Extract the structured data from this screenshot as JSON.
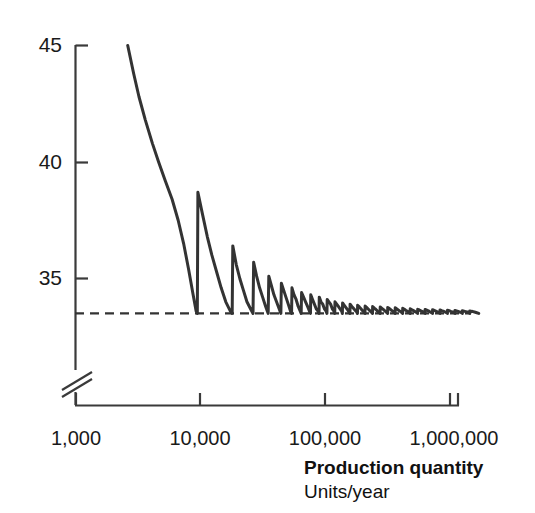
{
  "chart_data": {
    "type": "line",
    "title": "",
    "xlabel": "Production quantity",
    "xlabel_sub": "Units/year",
    "ylabel": "",
    "xscale": "log",
    "xlim": [
      1000,
      2000000
    ],
    "ylim": [
      33.0,
      45.0
    ],
    "y_axis_break": true,
    "grid": false,
    "legend": null,
    "x_tick_labels": [
      "1,000",
      "10,000",
      "100,000",
      "1,000,000"
    ],
    "x_tick_values": [
      1000,
      10000,
      100000,
      1000000
    ],
    "y_tick_labels": [
      "45",
      "40",
      "35"
    ],
    "y_tick_values": [
      45,
      40,
      35
    ],
    "line_color": "#333333",
    "asymptote": {
      "value": 33.5,
      "style": "dashed",
      "color": "#333333",
      "label": ""
    },
    "series": [
      {
        "name": "Unit cost",
        "points": [
          [
            2600,
            45.0
          ],
          [
            2900,
            43.8
          ],
          [
            3200,
            42.8
          ],
          [
            3600,
            41.8
          ],
          [
            4100,
            40.8
          ],
          [
            4600,
            40.0
          ],
          [
            5200,
            39.2
          ],
          [
            5900,
            38.4
          ],
          [
            6600,
            37.5
          ],
          [
            7300,
            36.5
          ],
          [
            8000,
            35.4
          ],
          [
            8700,
            34.3
          ],
          [
            9200,
            33.6
          ],
          [
            9400,
            33.5
          ],
          [
            9500,
            38.7
          ],
          [
            10400,
            37.7
          ],
          [
            11300,
            36.8
          ],
          [
            12300,
            36.0
          ],
          [
            13400,
            35.3
          ],
          [
            14600,
            34.6
          ],
          [
            15900,
            34.0
          ],
          [
            17300,
            33.6
          ],
          [
            17900,
            33.5
          ],
          [
            18100,
            36.4
          ],
          [
            19300,
            35.6
          ],
          [
            20600,
            35.0
          ],
          [
            22000,
            34.5
          ],
          [
            23500,
            34.0
          ],
          [
            25100,
            33.7
          ],
          [
            26300,
            33.5
          ],
          [
            26600,
            35.7
          ],
          [
            28100,
            35.1
          ],
          [
            29700,
            34.6
          ],
          [
            31400,
            34.2
          ],
          [
            33200,
            33.8
          ],
          [
            34800,
            33.5
          ],
          [
            35200,
            35.1
          ],
          [
            36900,
            34.7
          ],
          [
            38700,
            34.3
          ],
          [
            40600,
            34.0
          ],
          [
            42600,
            33.7
          ],
          [
            44000,
            33.5
          ],
          [
            44400,
            34.8
          ],
          [
            46300,
            34.5
          ],
          [
            48300,
            34.2
          ],
          [
            50400,
            33.9
          ],
          [
            52500,
            33.6
          ],
          [
            53600,
            33.5
          ],
          [
            54000,
            34.6
          ],
          [
            56100,
            34.3
          ],
          [
            58300,
            34.1
          ],
          [
            60600,
            33.8
          ],
          [
            62900,
            33.6
          ],
          [
            64000,
            33.5
          ],
          [
            64500,
            34.4
          ],
          [
            66900,
            34.2
          ],
          [
            69400,
            34.0
          ],
          [
            72000,
            33.8
          ],
          [
            74600,
            33.6
          ],
          [
            76000,
            33.5
          ],
          [
            76400,
            34.3
          ],
          [
            79000,
            34.1
          ],
          [
            81700,
            33.9
          ],
          [
            84500,
            33.7
          ],
          [
            87300,
            33.6
          ],
          [
            89000,
            33.5
          ],
          [
            89400,
            34.2
          ],
          [
            92300,
            34.0
          ],
          [
            95300,
            33.9
          ],
          [
            98300,
            33.7
          ],
          [
            101400,
            33.6
          ],
          [
            103000,
            33.5
          ],
          [
            103500,
            34.1
          ],
          [
            106800,
            34.0
          ],
          [
            110200,
            33.9
          ],
          [
            113700,
            33.7
          ],
          [
            117200,
            33.6
          ],
          [
            119000,
            33.5
          ],
          [
            119500,
            34.0
          ],
          [
            123300,
            33.9
          ],
          [
            127200,
            33.8
          ],
          [
            131200,
            33.7
          ],
          [
            135200,
            33.6
          ],
          [
            137000,
            33.5
          ],
          [
            137500,
            33.95
          ],
          [
            141900,
            33.85
          ],
          [
            146400,
            33.75
          ],
          [
            151000,
            33.65
          ],
          [
            155600,
            33.55
          ],
          [
            157500,
            33.5
          ],
          [
            158000,
            33.9
          ],
          [
            163000,
            33.8
          ],
          [
            168100,
            33.72
          ],
          [
            173300,
            33.64
          ],
          [
            178600,
            33.56
          ],
          [
            181000,
            33.5
          ],
          [
            181500,
            33.85
          ],
          [
            187200,
            33.78
          ],
          [
            193000,
            33.7
          ],
          [
            198900,
            33.62
          ],
          [
            204900,
            33.55
          ],
          [
            208000,
            33.5
          ],
          [
            208500,
            33.82
          ],
          [
            215000,
            33.75
          ],
          [
            221600,
            33.68
          ],
          [
            228300,
            33.61
          ],
          [
            235100,
            33.54
          ],
          [
            239000,
            33.5
          ],
          [
            239500,
            33.8
          ],
          [
            247000,
            33.73
          ],
          [
            254600,
            33.67
          ],
          [
            262300,
            33.6
          ],
          [
            270100,
            33.54
          ],
          [
            275000,
            33.5
          ],
          [
            275500,
            33.78
          ],
          [
            284200,
            33.72
          ],
          [
            293000,
            33.66
          ],
          [
            301900,
            33.6
          ],
          [
            310900,
            33.54
          ],
          [
            316000,
            33.5
          ],
          [
            316500,
            33.76
          ],
          [
            326500,
            33.71
          ],
          [
            336600,
            33.65
          ],
          [
            346800,
            33.6
          ],
          [
            357100,
            33.54
          ],
          [
            363000,
            33.5
          ],
          [
            363500,
            33.74
          ],
          [
            375000,
            33.69
          ],
          [
            386600,
            33.64
          ],
          [
            398300,
            33.59
          ],
          [
            410100,
            33.54
          ],
          [
            417000,
            33.5
          ],
          [
            417500,
            33.72
          ],
          [
            430600,
            33.68
          ],
          [
            443800,
            33.63
          ],
          [
            457100,
            33.59
          ],
          [
            470500,
            33.54
          ],
          [
            479000,
            33.5
          ],
          [
            479500,
            33.7
          ],
          [
            494400,
            33.66
          ],
          [
            509400,
            33.62
          ],
          [
            524500,
            33.58
          ],
          [
            539700,
            33.54
          ],
          [
            550000,
            33.5
          ],
          [
            550500,
            33.68
          ],
          [
            567500,
            33.65
          ],
          [
            584600,
            33.61
          ],
          [
            601800,
            33.58
          ],
          [
            619100,
            33.54
          ],
          [
            631000,
            33.5
          ],
          [
            631500,
            33.67
          ],
          [
            651000,
            33.64
          ],
          [
            670600,
            33.61
          ],
          [
            690300,
            33.57
          ],
          [
            710100,
            33.54
          ],
          [
            724000,
            33.5
          ],
          [
            724500,
            33.66
          ],
          [
            747000,
            33.63
          ],
          [
            769600,
            33.6
          ],
          [
            792300,
            33.57
          ],
          [
            815100,
            33.54
          ],
          [
            831000,
            33.5
          ],
          [
            831500,
            33.65
          ],
          [
            857300,
            33.62
          ],
          [
            883200,
            33.6
          ],
          [
            909200,
            33.57
          ],
          [
            935300,
            33.54
          ],
          [
            954000,
            33.5
          ],
          [
            954500,
            33.64
          ],
          [
            984000,
            33.62
          ],
          [
            1013600,
            33.59
          ],
          [
            1043300,
            33.57
          ],
          [
            1073100,
            33.54
          ],
          [
            1095000,
            33.5
          ],
          [
            1095500,
            33.63
          ],
          [
            1129000,
            33.61
          ],
          [
            1162700,
            33.59
          ],
          [
            1196500,
            33.56
          ],
          [
            1230400,
            33.54
          ],
          [
            1256000,
            33.5
          ],
          [
            1256500,
            33.62
          ],
          [
            1295000,
            33.6
          ],
          [
            1333700,
            33.58
          ],
          [
            1372500,
            33.56
          ],
          [
            1411400,
            33.54
          ],
          [
            1441000,
            33.5
          ],
          [
            1441500,
            33.61
          ],
          [
            1485000,
            33.59
          ],
          [
            1529000,
            33.58
          ],
          [
            1573200,
            33.56
          ],
          [
            1617500,
            33.54
          ],
          [
            1700000,
            33.5
          ]
        ]
      }
    ]
  },
  "axes": {
    "y_ticks": [
      {
        "label": "45",
        "value": 45
      },
      {
        "label": "40",
        "value": 40
      },
      {
        "label": "35",
        "value": 35
      }
    ],
    "x_ticks": [
      {
        "label": "1,000",
        "value": 1000
      },
      {
        "label": "10,000",
        "value": 10000
      },
      {
        "label": "100,000",
        "value": 100000
      },
      {
        "label": "1,000,000",
        "value": 1000000
      }
    ],
    "break_marker": "axis-break"
  },
  "labels": {
    "x_axis_title": "Production quantity",
    "x_axis_units": "Units/year"
  },
  "style": {
    "line_color": "#333333",
    "axis_color": "#3a3a3a",
    "text_color": "#1a1a1a",
    "background": "#ffffff"
  }
}
